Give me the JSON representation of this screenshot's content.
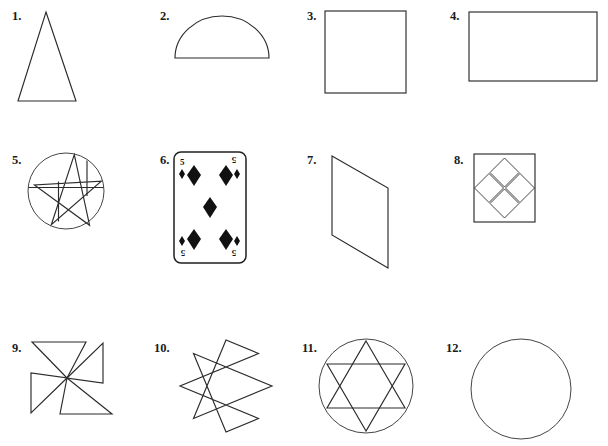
{
  "page": {
    "background_color": "#ffffff",
    "ink_color": "#2b2b2b",
    "width": 608,
    "height": 446,
    "rows": 3,
    "columns": 4,
    "total_items": 12
  },
  "items": [
    {
      "number": "1.",
      "shape_name": "isosceles-triangle",
      "description": "Tall narrow isosceles triangle",
      "label_x": 10,
      "label_y": 8
    },
    {
      "number": "2.",
      "shape_name": "semicircle",
      "description": "Semicircle with flat side at bottom",
      "label_x": 158,
      "label_y": 8
    },
    {
      "number": "3.",
      "shape_name": "square",
      "description": "Square outline",
      "label_x": 305,
      "label_y": 8
    },
    {
      "number": "4.",
      "shape_name": "rectangle",
      "description": "Wide rectangle outline",
      "label_x": 448,
      "label_y": 8
    },
    {
      "number": "5.",
      "shape_name": "pentagram-in-circle",
      "description": "Five pointed star inscribed in a circle",
      "label_x": 10,
      "label_y": 152
    },
    {
      "number": "6.",
      "shape_name": "playing-card-five-of-diamonds",
      "description": "Playing card showing the five of diamonds",
      "label_x": 158,
      "label_y": 152
    },
    {
      "number": "7.",
      "shape_name": "parallelogram",
      "description": "Slanted parallelogram / rhomboid",
      "label_x": 305,
      "label_y": 152
    },
    {
      "number": "8.",
      "shape_name": "square-with-four-diamonds",
      "description": "Square containing four overlapping diamonds in a cross arrangement",
      "label_x": 452,
      "label_y": 152
    },
    {
      "number": "9.",
      "shape_name": "pinwheel",
      "description": "Four bladed pinwheel / windmill",
      "label_x": 10,
      "label_y": 340
    },
    {
      "number": "10.",
      "shape_name": "octagram",
      "description": "Eight pointed star polygon",
      "label_x": 152,
      "label_y": 340
    },
    {
      "number": "11.",
      "shape_name": "hexagram-in-circle",
      "description": "Six pointed star inscribed in a circle",
      "label_x": 300,
      "label_y": 340
    },
    {
      "number": "12.",
      "shape_name": "circle",
      "description": "Plain circle outline",
      "label_x": 444,
      "label_y": 340
    }
  ],
  "card": {
    "rank_top_left": "5",
    "rank_top_right": "5",
    "rank_bottom_left": "5",
    "rank_bottom_right": "5",
    "suit": "diamonds",
    "pip_count": 5
  }
}
